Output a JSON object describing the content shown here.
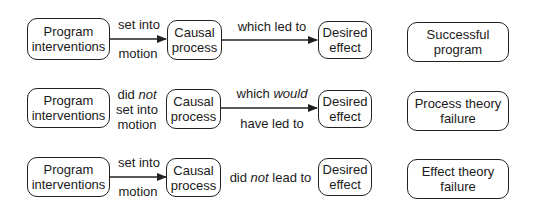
{
  "diagram": {
    "rows": [
      {
        "id": "row-success",
        "nodes": {
          "intervention": [
            "Program",
            "interventions"
          ],
          "process": [
            "Causal",
            "process"
          ],
          "effect": [
            "Desired",
            "effect"
          ],
          "outcome": [
            "Successful",
            "program"
          ]
        },
        "link1": {
          "top": "set into",
          "bottom": "motion",
          "arrow": true
        },
        "link2": {
          "text_before": "which led to",
          "arrow": true
        }
      },
      {
        "id": "row-process-failure",
        "nodes": {
          "intervention": [
            "Program",
            "interventions"
          ],
          "process": [
            "Causal",
            "process"
          ],
          "effect": [
            "Desired",
            "effect"
          ],
          "outcome": [
            "Process theory",
            "failure"
          ]
        },
        "link1": {
          "line1_plain": "did ",
          "line1_italic": "not",
          "line2": "set into",
          "line3": "motion",
          "arrow": false
        },
        "link2": {
          "top_plain": "which ",
          "top_italic": "would",
          "bottom": "have led to",
          "arrow": true
        }
      },
      {
        "id": "row-effect-failure",
        "nodes": {
          "intervention": [
            "Program",
            "interventions"
          ],
          "process": [
            "Causal",
            "process"
          ],
          "effect": [
            "Desired",
            "effect"
          ],
          "outcome": [
            "Effect theory",
            "failure"
          ]
        },
        "link1": {
          "top": "set into",
          "bottom": "motion",
          "arrow": true
        },
        "link2": {
          "plain_before": "did ",
          "italic": "not",
          "plain_after": " lead to",
          "arrow": false
        }
      }
    ],
    "colors": {
      "stroke": "#222222",
      "text": "#1a1a1a",
      "background": "#ffffff"
    }
  }
}
